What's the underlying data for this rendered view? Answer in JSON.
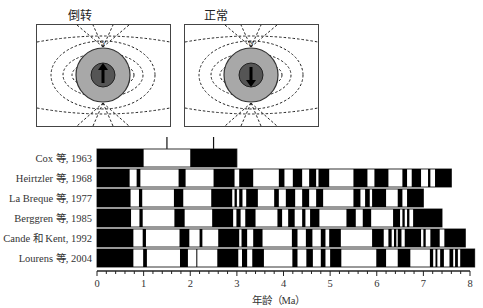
{
  "diagrams": [
    {
      "title": "倒转",
      "pole_label": "S",
      "arrow_direction": "up"
    },
    {
      "title": "正常",
      "pole_label": "N",
      "arrow_direction": "down"
    }
  ],
  "chart_data": {
    "type": "polarity-timescale",
    "title": "",
    "xlabel": "年龄（Ma）",
    "xlim": [
      0,
      8
    ],
    "xticks": [
      "0",
      "1",
      "2",
      "3",
      "4",
      "5",
      "6",
      "7",
      "8"
    ],
    "minor_tick_step": 0.2,
    "legend": {
      "black": "normal polarity",
      "white": "reversed polarity"
    },
    "markers_above_first_row": [
      1.5,
      2.5
    ],
    "rows": [
      {
        "label": "Cox 等, 1963",
        "end": 3.0,
        "normal": [
          [
            0,
            1.0
          ],
          [
            2.0,
            3.0
          ]
        ]
      },
      {
        "label": "Heirtzler 等, 1968",
        "end": 7.6,
        "normal": [
          [
            0,
            0.7
          ],
          [
            0.85,
            0.93
          ],
          [
            1.75,
            1.9
          ],
          [
            2.5,
            2.95
          ],
          [
            3.05,
            3.35
          ],
          [
            3.9,
            4.02
          ],
          [
            4.2,
            4.4
          ],
          [
            4.55,
            4.7
          ],
          [
            4.75,
            4.98
          ],
          [
            5.5,
            5.8
          ],
          [
            5.95,
            6.25
          ],
          [
            6.55,
            6.65
          ],
          [
            6.75,
            6.95
          ],
          [
            7.1,
            7.15
          ],
          [
            7.25,
            7.6
          ]
        ]
      },
      {
        "label": "La Breque 等, 1977",
        "end": 7.0,
        "normal": [
          [
            0,
            0.72
          ],
          [
            0.9,
            0.97
          ],
          [
            1.65,
            1.85
          ],
          [
            2.45,
            2.9
          ],
          [
            2.95,
            3.0
          ],
          [
            3.05,
            3.12
          ],
          [
            3.2,
            3.45
          ],
          [
            3.8,
            3.9
          ],
          [
            4.05,
            4.25
          ],
          [
            4.4,
            4.55
          ],
          [
            4.7,
            4.85
          ],
          [
            5.5,
            5.65
          ],
          [
            5.75,
            5.85
          ],
          [
            5.9,
            6.2
          ],
          [
            6.45,
            6.55
          ],
          [
            6.65,
            7.0
          ]
        ]
      },
      {
        "label": "Berggren 等, 1985",
        "end": 7.4,
        "normal": [
          [
            0,
            0.73
          ],
          [
            0.91,
            0.98
          ],
          [
            1.66,
            1.88
          ],
          [
            2.47,
            2.92
          ],
          [
            2.99,
            3.08
          ],
          [
            3.18,
            3.4
          ],
          [
            3.87,
            3.97
          ],
          [
            4.1,
            4.24
          ],
          [
            4.4,
            4.47
          ],
          [
            4.57,
            4.77
          ],
          [
            5.35,
            5.55
          ],
          [
            5.7,
            5.88
          ],
          [
            6.35,
            6.5
          ],
          [
            6.55,
            6.6
          ],
          [
            6.65,
            6.7
          ],
          [
            6.78,
            7.4
          ]
        ]
      },
      {
        "label": "Cande 和 Kent, 1992",
        "end": 7.9,
        "normal": [
          [
            0,
            0.78
          ],
          [
            0.98,
            1.05
          ],
          [
            1.77,
            1.98
          ],
          [
            2.2,
            2.26
          ],
          [
            2.6,
            3.05
          ],
          [
            3.1,
            3.22
          ],
          [
            3.35,
            3.55
          ],
          [
            4.18,
            4.3
          ],
          [
            4.48,
            4.62
          ],
          [
            4.8,
            4.9
          ],
          [
            4.98,
            5.23
          ],
          [
            5.9,
            6.15
          ],
          [
            6.25,
            6.32
          ],
          [
            6.37,
            6.42
          ],
          [
            6.45,
            6.53
          ],
          [
            6.6,
            6.95
          ],
          [
            7.0,
            7.05
          ],
          [
            7.15,
            7.35
          ],
          [
            7.45,
            7.9
          ]
        ]
      },
      {
        "label": "Lourens 等, 2004",
        "end": 8.1,
        "normal": [
          [
            0,
            0.78
          ],
          [
            0.99,
            1.07
          ],
          [
            1.78,
            1.95
          ],
          [
            2.13,
            2.15
          ],
          [
            2.58,
            3.03
          ],
          [
            3.11,
            3.22
          ],
          [
            3.33,
            3.58
          ],
          [
            4.19,
            4.3
          ],
          [
            4.49,
            4.63
          ],
          [
            4.8,
            4.9
          ],
          [
            5.0,
            5.24
          ],
          [
            5.99,
            6.2
          ],
          [
            6.45,
            6.72
          ],
          [
            7.14,
            7.21
          ],
          [
            7.26,
            7.3
          ],
          [
            7.36,
            7.44
          ],
          [
            7.56,
            7.64
          ],
          [
            7.68,
            7.74
          ],
          [
            7.79,
            8.1
          ]
        ]
      }
    ]
  }
}
